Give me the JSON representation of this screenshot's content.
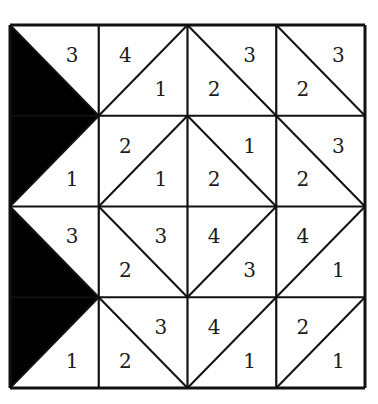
{
  "puzzle": {
    "grid": {
      "rows": 4,
      "cols": 4,
      "left": 10,
      "top": 25,
      "cell_w": 88.75,
      "cell_h": 90.75
    },
    "colors": {
      "line": "#111111",
      "fill": "#000000",
      "background": "#ffffff"
    },
    "cells": [
      {
        "r": 0,
        "c": 0,
        "diag": "\\",
        "shaded": "lower-left",
        "a": {
          "label": "3",
          "pos": "top-right"
        },
        "b": null
      },
      {
        "r": 0,
        "c": 1,
        "diag": "/",
        "a": {
          "label": "4",
          "pos": "top-left"
        },
        "b": {
          "label": "1",
          "pos": "bottom-right"
        }
      },
      {
        "r": 0,
        "c": 2,
        "diag": "\\",
        "a": {
          "label": "3",
          "pos": "top-right"
        },
        "b": {
          "label": "2",
          "pos": "bottom-left"
        }
      },
      {
        "r": 0,
        "c": 3,
        "diag": "\\",
        "a": {
          "label": "3",
          "pos": "top-right"
        },
        "b": {
          "label": "2",
          "pos": "bottom-left"
        }
      },
      {
        "r": 1,
        "c": 0,
        "diag": "/",
        "shaded": "upper-left",
        "a": null,
        "b": {
          "label": "1",
          "pos": "bottom-right"
        }
      },
      {
        "r": 1,
        "c": 1,
        "diag": "/",
        "a": {
          "label": "2",
          "pos": "top-left"
        },
        "b": {
          "label": "1",
          "pos": "bottom-right"
        }
      },
      {
        "r": 1,
        "c": 2,
        "diag": "\\",
        "a": {
          "label": "1",
          "pos": "top-right"
        },
        "b": {
          "label": "2",
          "pos": "bottom-left"
        }
      },
      {
        "r": 1,
        "c": 3,
        "diag": "\\",
        "a": {
          "label": "3",
          "pos": "top-right"
        },
        "b": {
          "label": "2",
          "pos": "bottom-left"
        }
      },
      {
        "r": 2,
        "c": 0,
        "diag": "\\",
        "shaded": "lower-left",
        "a": {
          "label": "3",
          "pos": "top-right"
        },
        "b": null
      },
      {
        "r": 2,
        "c": 1,
        "diag": "\\",
        "a": {
          "label": "3",
          "pos": "top-right"
        },
        "b": {
          "label": "2",
          "pos": "bottom-left"
        }
      },
      {
        "r": 2,
        "c": 2,
        "diag": "/",
        "a": {
          "label": "4",
          "pos": "top-left"
        },
        "b": {
          "label": "3",
          "pos": "bottom-right"
        }
      },
      {
        "r": 2,
        "c": 3,
        "diag": "/",
        "a": {
          "label": "4",
          "pos": "top-left"
        },
        "b": {
          "label": "1",
          "pos": "bottom-right"
        }
      },
      {
        "r": 3,
        "c": 0,
        "diag": "/",
        "shaded": "upper-left",
        "a": null,
        "b": {
          "label": "1",
          "pos": "bottom-right"
        }
      },
      {
        "r": 3,
        "c": 1,
        "diag": "\\",
        "a": {
          "label": "3",
          "pos": "top-right"
        },
        "b": {
          "label": "2",
          "pos": "bottom-left"
        }
      },
      {
        "r": 3,
        "c": 2,
        "diag": "/",
        "a": {
          "label": "4",
          "pos": "top-left"
        },
        "b": {
          "label": "1",
          "pos": "bottom-right"
        }
      },
      {
        "r": 3,
        "c": 3,
        "diag": "/",
        "a": {
          "label": "2",
          "pos": "top-left"
        },
        "b": {
          "label": "1",
          "pos": "bottom-right"
        }
      }
    ]
  }
}
